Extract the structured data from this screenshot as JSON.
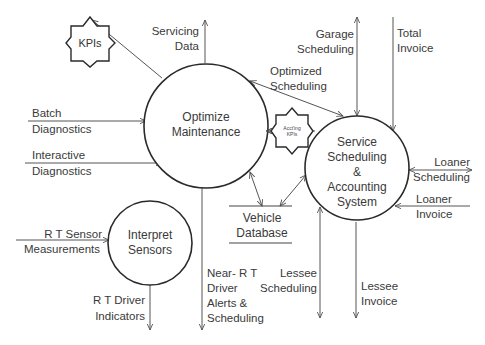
{
  "diagram": {
    "type": "data-flow-diagram",
    "processes": [
      {
        "id": "optimize",
        "lines": [
          "Optimize",
          "Maintenance"
        ]
      },
      {
        "id": "service",
        "lines": [
          "Service",
          "Scheduling",
          "&",
          "Accounting",
          "System"
        ]
      },
      {
        "id": "interpret",
        "lines": [
          "Interpret",
          "Sensors"
        ]
      }
    ],
    "data_store": {
      "lines": [
        "Vehicle",
        "Database"
      ]
    },
    "kpi_stars": [
      {
        "id": "kpis",
        "label": "KPIs"
      },
      {
        "id": "acct-kpis",
        "lines": [
          "Acct'ing",
          "KPIs"
        ]
      }
    ],
    "flows": {
      "servicing_data": [
        "Servicing",
        "Data"
      ],
      "batch_diag": [
        "Batch",
        "Diagnostics"
      ],
      "interactive_diag": [
        "Interactive",
        "Diagnostics"
      ],
      "garage_sched": [
        "Garage",
        "Scheduling"
      ],
      "total_invoice": [
        "Total",
        "Invoice"
      ],
      "optimized_sched": [
        "Optimized",
        "Scheduling"
      ],
      "loaner_sched": [
        "Loaner",
        "Scheduling"
      ],
      "loaner_invoice": [
        "Loaner",
        "Invoice"
      ],
      "rt_sensor": [
        "R T Sensor",
        "Measurements"
      ],
      "rt_driver": [
        "R T Driver",
        "Indicators"
      ],
      "near_rt": [
        "Near- R T",
        "Driver",
        "Alerts &",
        "Scheduling"
      ],
      "lessee_sched": [
        "Lessee",
        "Scheduling"
      ],
      "lessee_invoice": [
        "Lessee",
        "Invoice"
      ]
    }
  }
}
